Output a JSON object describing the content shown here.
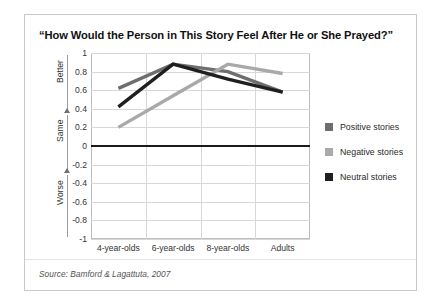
{
  "chart_data": {
    "type": "line",
    "title": "“How Would the Person in This Story Feel After He or She Prayed?”",
    "categories": [
      "4-year-olds",
      "6-year-olds",
      "8-year-olds",
      "Adults"
    ],
    "series": [
      {
        "name": "Positive stories",
        "values": [
          0.62,
          0.88,
          0.8,
          0.58
        ],
        "color": "#6e6e6e"
      },
      {
        "name": "Negative stories",
        "values": [
          0.2,
          0.54,
          0.88,
          0.78
        ],
        "color": "#a9a9a9"
      },
      {
        "name": "Neutral stories",
        "values": [
          0.42,
          0.88,
          0.72,
          0.58
        ],
        "color": "#1f1f1f"
      }
    ],
    "xlabel": "",
    "ylabel": "",
    "ylim": [
      -1,
      1
    ],
    "yticks": [
      1,
      0.8,
      0.6,
      0.4,
      0.2,
      0,
      -0.2,
      -0.4,
      -0.6,
      -0.8,
      -1
    ],
    "ytick_labels": [
      "1",
      "0.8",
      "0.6",
      "0.4",
      "0.2",
      "0",
      "-0.2",
      "-0.4",
      "-0.6",
      "-0.8",
      "-1"
    ],
    "grid": true,
    "zero_line": true,
    "legend_position": "right",
    "axis_annotations": [
      {
        "label": "Better",
        "direction": "up"
      },
      {
        "label": "Same",
        "direction": "up"
      },
      {
        "label": "Worse",
        "direction": "down"
      }
    ]
  },
  "source": {
    "text": "Source: Bamford & Lagattuta, 2007"
  },
  "colors": {
    "positive": "#6e6e6e",
    "negative": "#a9a9a9",
    "neutral": "#1f1f1f",
    "grid": "#d8d8d8",
    "zero": "#1a1a1a",
    "frame": "#c9c9c9"
  }
}
